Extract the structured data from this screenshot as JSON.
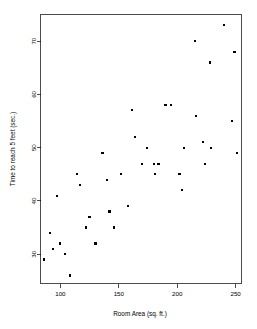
{
  "chart_data": {
    "type": "scatter",
    "title": "",
    "subtitle": "",
    "xlabel": "Room Area (sq. ft.)",
    "ylabel": "Time to reach 5 feet (sec.)",
    "xlim": [
      83,
      255
    ],
    "ylim": [
      24.5,
      75
    ],
    "xticks": [
      100,
      150,
      200,
      250
    ],
    "yticks": [
      30,
      40,
      50,
      60,
      70
    ],
    "xtick_labels": [
      "100",
      "150",
      "200",
      "250"
    ],
    "ytick_labels": [
      "30",
      "40",
      "50",
      "60",
      "70"
    ],
    "grid": false,
    "legend": false,
    "legend_position": "none",
    "marker": "filled-square",
    "marker_color": "#000000",
    "marker_size": 2.2,
    "frame": "box",
    "background_color": "#ffffff",
    "n_points": 40,
    "points": [
      {
        "x": 86,
        "y": 29
      },
      {
        "x": 91,
        "y": 34
      },
      {
        "x": 94,
        "y": 31
      },
      {
        "x": 97,
        "y": 41
      },
      {
        "x": 100,
        "y": 32
      },
      {
        "x": 104,
        "y": 30
      },
      {
        "x": 108,
        "y": 26
      },
      {
        "x": 114,
        "y": 45
      },
      {
        "x": 117,
        "y": 43
      },
      {
        "x": 122,
        "y": 35
      },
      {
        "x": 125,
        "y": 37
      },
      {
        "x": 130,
        "y": 32
      },
      {
        "x": 136,
        "y": 49
      },
      {
        "x": 140,
        "y": 44
      },
      {
        "x": 142,
        "y": 38
      },
      {
        "x": 146,
        "y": 35
      },
      {
        "x": 152,
        "y": 45
      },
      {
        "x": 158,
        "y": 39
      },
      {
        "x": 161,
        "y": 57
      },
      {
        "x": 164,
        "y": 52
      },
      {
        "x": 170,
        "y": 47
      },
      {
        "x": 174,
        "y": 50
      },
      {
        "x": 180,
        "y": 47
      },
      {
        "x": 181,
        "y": 45
      },
      {
        "x": 184,
        "y": 47
      },
      {
        "x": 190,
        "y": 58
      },
      {
        "x": 195,
        "y": 58
      },
      {
        "x": 202,
        "y": 45
      },
      {
        "x": 204,
        "y": 42
      },
      {
        "x": 206,
        "y": 50
      },
      {
        "x": 215,
        "y": 70
      },
      {
        "x": 216,
        "y": 56
      },
      {
        "x": 222,
        "y": 51
      },
      {
        "x": 224,
        "y": 47
      },
      {
        "x": 228,
        "y": 66
      },
      {
        "x": 229,
        "y": 50
      },
      {
        "x": 240,
        "y": 73
      },
      {
        "x": 247,
        "y": 55
      },
      {
        "x": 249,
        "y": 68
      },
      {
        "x": 251,
        "y": 49
      }
    ]
  }
}
